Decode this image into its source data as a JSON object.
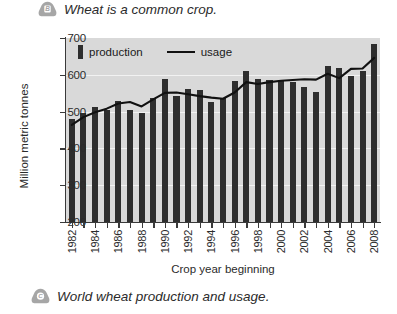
{
  "captions": {
    "top": {
      "badge": "B",
      "text": "Wheat is a common crop."
    },
    "bottom": {
      "badge": "C",
      "text": "World wheat production and usage."
    }
  },
  "legend": {
    "production_label": "production",
    "usage_label": "usage"
  },
  "colors": {
    "plot_background": "#d9d9d9",
    "bar": "#2e2e2e",
    "line": "#111111",
    "gridline": "#f2f2f2",
    "axis": "#3a3a3a",
    "badge": "#a6a6a6"
  },
  "chart_data": {
    "type": "bar",
    "title": "",
    "xlabel": "Crop year beginning",
    "ylabel": "Million metric tonnes",
    "ylim": [
      200,
      700
    ],
    "yticks": [
      200,
      300,
      400,
      500,
      600,
      700
    ],
    "grid": true,
    "legend_position": "top-left",
    "categories": [
      1982,
      1983,
      1984,
      1985,
      1986,
      1987,
      1988,
      1989,
      1990,
      1991,
      1992,
      1993,
      1994,
      1995,
      1996,
      1997,
      1998,
      1999,
      2000,
      2001,
      2002,
      2003,
      2004,
      2005,
      2006,
      2007,
      2008
    ],
    "xtick_labels": [
      "1982",
      "1984",
      "1986",
      "1988",
      "1990",
      "1992",
      "1994",
      "1996",
      "1998",
      "2000",
      "2002",
      "2004",
      "2006",
      "2008"
    ],
    "series": [
      {
        "name": "production",
        "type": "bar",
        "values": [
          480,
          495,
          513,
          504,
          529,
          505,
          495,
          537,
          588,
          543,
          562,
          558,
          525,
          538,
          582,
          610,
          589,
          585,
          582,
          581,
          567,
          554,
          625,
          619,
          596,
          611,
          683
        ]
      },
      {
        "name": "usage",
        "type": "line",
        "values": [
          464,
          485,
          498,
          508,
          522,
          526,
          514,
          533,
          551,
          552,
          547,
          542,
          538,
          535,
          552,
          580,
          575,
          580,
          584,
          586,
          588,
          587,
          603,
          591,
          616,
          617,
          646
        ]
      }
    ]
  }
}
